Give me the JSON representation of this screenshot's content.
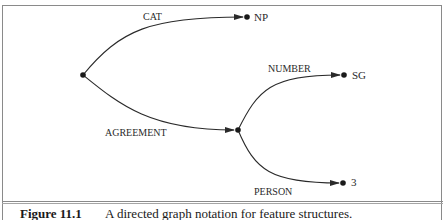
{
  "figure": {
    "caption_label": "Figure 11.1",
    "caption_text": "A directed graph notation for feature structures."
  },
  "graph": {
    "nodes": {
      "root": {
        "label": "",
        "x": 83,
        "y": 75
      },
      "np": {
        "label": "NP",
        "x": 247,
        "y": 17
      },
      "agr": {
        "label": "",
        "x": 238,
        "y": 130
      },
      "sg": {
        "label": "SG",
        "x": 344,
        "y": 75
      },
      "three": {
        "label": "3",
        "x": 343,
        "y": 183
      }
    },
    "edges": {
      "cat": {
        "label": "CAT",
        "from": "root",
        "to": "np"
      },
      "agreement": {
        "label": "AGREEMENT",
        "from": "root",
        "to": "agr"
      },
      "number": {
        "label": "NUMBER",
        "from": "agr",
        "to": "sg"
      },
      "person": {
        "label": "PERSON",
        "from": "agr",
        "to": "three"
      }
    }
  },
  "colors": {
    "line": "#2a2a2a",
    "frame": "#8a8a8a"
  }
}
